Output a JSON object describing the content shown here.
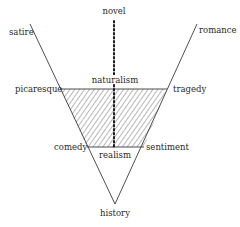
{
  "diagram": {
    "type": "inverted-triangle genre diagram",
    "colors": {
      "line": "#3a3a3a",
      "hatch": "#4a4a4a",
      "dots": "#1a1a1a",
      "background": "#ffffff"
    },
    "labels": {
      "novel": "novel",
      "satire": "satire",
      "romance": "romance",
      "naturalism": "naturalism",
      "picaresque": "picaresque",
      "tragedy": "tragedy",
      "comedy": "comedy",
      "realism": "realism",
      "sentiment": "sentiment",
      "history": "history"
    },
    "geometry": {
      "left_arm": {
        "x1": 30,
        "y1": 24,
        "x2": 115,
        "y2": 204
      },
      "right_arm": {
        "x1": 197,
        "y1": 24,
        "x2": 115,
        "y2": 204
      },
      "hatched_band": {
        "top_y": 89,
        "top_left_x": 60,
        "top_right_x": 167,
        "bottom_y": 147,
        "bottom_left_x": 87,
        "bottom_right_x": 144
      },
      "dotted_axis": {
        "x": 114,
        "y_start": 20,
        "y_end": 148
      }
    }
  }
}
